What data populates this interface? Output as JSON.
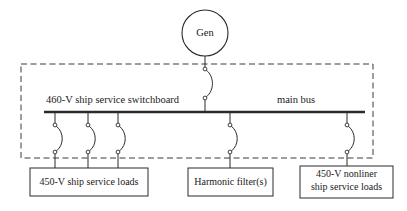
{
  "diagram": {
    "colors": {
      "line": "#2b2b2b",
      "dashed_boundary": "#3a3a3a",
      "text": "#1a1a1a",
      "background": "#ffffff"
    },
    "source": {
      "label": "Gen",
      "symbol": "generator-circle"
    },
    "bus": {
      "left_label": "460-V ship service switchboard",
      "right_label": "main bus"
    },
    "boundary": {
      "style": "dashed",
      "name": "switchboard-enclosure"
    },
    "breakers": {
      "symbol": "circuit-breaker-arc",
      "count": 6
    },
    "loads": [
      {
        "name": "ship-service-loads",
        "line1": "450-V ship service loads",
        "line2": ""
      },
      {
        "name": "harmonic-filters",
        "line1": "Harmonic filter(s)",
        "line2": ""
      },
      {
        "name": "nonlinear-ship-service-loads",
        "line1": "450-V nonliner",
        "line2": "ship service loads"
      }
    ]
  }
}
